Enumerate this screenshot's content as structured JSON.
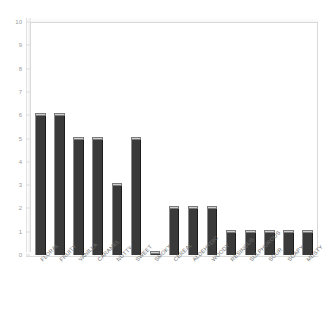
{
  "chart_data": {
    "type": "bar",
    "title": "",
    "subtitle": "",
    "xlabel": "",
    "ylabel": "",
    "ylim": [
      0,
      10
    ],
    "y_ticks": [
      0,
      1,
      2,
      3,
      4,
      5,
      6,
      7,
      8,
      9,
      10
    ],
    "grid": false,
    "legend": false,
    "legend_position": "none",
    "bar_color": "#3a3a3a",
    "bar_top_color": "#cfcfcf",
    "frame_color": "#d9d9d9",
    "tick_label_color": "#9a9a9a",
    "category_label_color": "#6f6f6f",
    "category_label_rotation": -45,
    "categories": [
      "FLORAL",
      "FRUITY",
      "VANILLA",
      "CARAMEL",
      "NUTTY",
      "SWEET",
      "SMOKY",
      "CEREAL",
      "ALDEHYDIC",
      "WOODY",
      "RESINOUS",
      "SULPHUROUS",
      "SOUR",
      "SOAPY",
      "MUSTY"
    ],
    "values": [
      6,
      6,
      5,
      5,
      3,
      5,
      0.1,
      2,
      2,
      2,
      1,
      1,
      1,
      1,
      1
    ]
  }
}
